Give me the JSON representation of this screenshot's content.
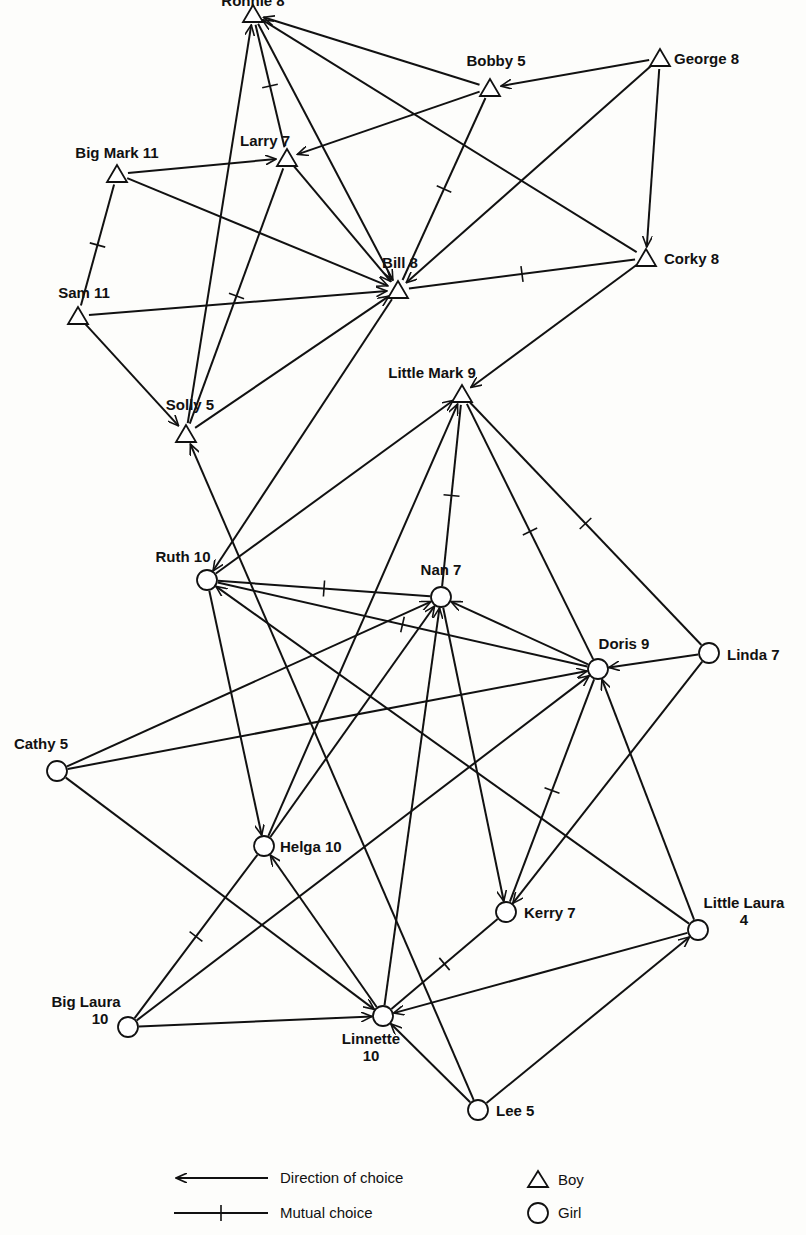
{
  "nodes": [
    {
      "id": "ronnie",
      "name": "Ronnie",
      "score": "8",
      "gender": "boy",
      "x": 253,
      "y": 14,
      "label_dx": 0,
      "label_dy": -8,
      "anchor": "middle"
    },
    {
      "id": "bobby",
      "name": "Bobby",
      "score": "5",
      "gender": "boy",
      "x": 490,
      "y": 88,
      "label_dx": 6,
      "label_dy": -22,
      "anchor": "middle"
    },
    {
      "id": "george",
      "name": "George",
      "score": "8",
      "gender": "boy",
      "x": 660,
      "y": 58,
      "label_dx": 14,
      "label_dy": 6,
      "anchor": "start"
    },
    {
      "id": "larry",
      "name": "Larry",
      "score": "7",
      "gender": "boy",
      "x": 287,
      "y": 158,
      "label_dx": -22,
      "label_dy": -12,
      "anchor": "middle"
    },
    {
      "id": "bigmark",
      "name": "Big Mark",
      "score": "11",
      "gender": "boy",
      "x": 117,
      "y": 174,
      "label_dx": 0,
      "label_dy": -16,
      "anchor": "middle"
    },
    {
      "id": "bill",
      "name": "Bill",
      "score": "8",
      "gender": "boy",
      "x": 398,
      "y": 290,
      "label_dx": 2,
      "label_dy": -22,
      "anchor": "middle"
    },
    {
      "id": "corky",
      "name": "Corky",
      "score": "8",
      "gender": "boy",
      "x": 646,
      "y": 258,
      "label_dx": 18,
      "label_dy": 6,
      "anchor": "start"
    },
    {
      "id": "sam",
      "name": "Sam",
      "score": "11",
      "gender": "boy",
      "x": 78,
      "y": 316,
      "label_dx": 6,
      "label_dy": -18,
      "anchor": "middle"
    },
    {
      "id": "littlemark",
      "name": "Little Mark",
      "score": "9",
      "gender": "boy",
      "x": 462,
      "y": 394,
      "label_dx": -30,
      "label_dy": -16,
      "anchor": "middle"
    },
    {
      "id": "solly",
      "name": "Solly",
      "score": "5",
      "gender": "boy",
      "x": 186,
      "y": 434,
      "label_dx": 4,
      "label_dy": -24,
      "anchor": "middle"
    },
    {
      "id": "ruth",
      "name": "Ruth",
      "score": "10",
      "gender": "girl",
      "x": 207,
      "y": 580,
      "label_dx": -24,
      "label_dy": -18,
      "anchor": "middle"
    },
    {
      "id": "nan",
      "name": "Nan",
      "score": "7",
      "gender": "girl",
      "x": 441,
      "y": 597,
      "label_dx": 0,
      "label_dy": -22,
      "anchor": "middle"
    },
    {
      "id": "doris",
      "name": "Doris",
      "score": "9",
      "gender": "girl",
      "x": 598,
      "y": 669,
      "label_dx": 26,
      "label_dy": -20,
      "anchor": "middle"
    },
    {
      "id": "linda",
      "name": "Linda",
      "score": "7",
      "gender": "girl",
      "x": 709,
      "y": 653,
      "label_dx": 18,
      "label_dy": 7,
      "anchor": "start"
    },
    {
      "id": "cathy",
      "name": "Cathy",
      "score": "5",
      "gender": "girl",
      "x": 57,
      "y": 771,
      "label_dx": -16,
      "label_dy": -22,
      "anchor": "middle"
    },
    {
      "id": "helga",
      "name": "Helga",
      "score": "10",
      "gender": "girl",
      "x": 264,
      "y": 846,
      "label_dx": 16,
      "label_dy": 6,
      "anchor": "start"
    },
    {
      "id": "kerry",
      "name": "Kerry",
      "score": "7",
      "gender": "girl",
      "x": 506,
      "y": 912,
      "label_dx": 18,
      "label_dy": 6,
      "anchor": "start"
    },
    {
      "id": "littlelaura",
      "name": "Little Laura",
      "score": "4",
      "gender": "girl",
      "x": 698,
      "y": 930,
      "label_dx": 46,
      "label_dy": -22,
      "anchor": "middle",
      "multiline": true
    },
    {
      "id": "biglaura",
      "name": "Big Laura",
      "score": "10",
      "gender": "girl",
      "x": 128,
      "y": 1027,
      "label_dx": -42,
      "label_dy": -20,
      "anchor": "middle",
      "multiline": true
    },
    {
      "id": "linnette",
      "name": "Linnette",
      "score": "10",
      "gender": "girl",
      "x": 383,
      "y": 1016,
      "label_dx": -12,
      "label_dy": 28,
      "anchor": "middle",
      "multiline": true
    },
    {
      "id": "lee",
      "name": "Lee",
      "score": "5",
      "gender": "girl",
      "x": 478,
      "y": 1110,
      "label_dx": 18,
      "label_dy": 6,
      "anchor": "start"
    }
  ],
  "edges": [
    {
      "from": "bobby",
      "to": "ronnie",
      "type": "directed"
    },
    {
      "from": "george",
      "to": "bobby",
      "type": "directed"
    },
    {
      "from": "larry",
      "to": "ronnie",
      "type": "mutual"
    },
    {
      "from": "bobby",
      "to": "larry",
      "type": "directed"
    },
    {
      "from": "bigmark",
      "to": "larry",
      "type": "directed"
    },
    {
      "from": "ronnie",
      "to": "bill",
      "type": "directed"
    },
    {
      "from": "larry",
      "to": "bill",
      "type": "directed"
    },
    {
      "from": "bigmark",
      "to": "bill",
      "type": "directed"
    },
    {
      "from": "bobby",
      "to": "bill",
      "type": "mutual"
    },
    {
      "from": "george",
      "to": "bill",
      "type": "directed"
    },
    {
      "from": "george",
      "to": "corky",
      "type": "directed"
    },
    {
      "from": "corky",
      "to": "ronnie",
      "type": "directed"
    },
    {
      "from": "corky",
      "to": "bill",
      "type": "mutual"
    },
    {
      "from": "sam",
      "to": "bigmark",
      "type": "mutual"
    },
    {
      "from": "sam",
      "to": "bill",
      "type": "directed"
    },
    {
      "from": "sam",
      "to": "solly",
      "type": "directed"
    },
    {
      "from": "solly",
      "to": "ronnie",
      "type": "directed"
    },
    {
      "from": "solly",
      "to": "larry",
      "type": "mutual"
    },
    {
      "from": "solly",
      "to": "bill",
      "type": "directed"
    },
    {
      "from": "corky",
      "to": "littlemark",
      "type": "directed"
    },
    {
      "from": "bill",
      "to": "ruth",
      "type": "directed"
    },
    {
      "from": "ruth",
      "to": "littlemark",
      "type": "directed"
    },
    {
      "from": "lee",
      "to": "solly",
      "type": "directed"
    },
    {
      "from": "nan",
      "to": "littlemark",
      "type": "mutual"
    },
    {
      "from": "helga",
      "to": "littlemark",
      "type": "directed"
    },
    {
      "from": "doris",
      "to": "littlemark",
      "type": "mutual"
    },
    {
      "from": "linda",
      "to": "littlemark",
      "type": "mutual"
    },
    {
      "from": "ruth",
      "to": "nan",
      "type": "mutual"
    },
    {
      "from": "ruth",
      "to": "doris",
      "type": "mutual"
    },
    {
      "from": "doris",
      "to": "nan",
      "type": "directed"
    },
    {
      "from": "linda",
      "to": "doris",
      "type": "directed"
    },
    {
      "from": "cathy",
      "to": "nan",
      "type": "directed"
    },
    {
      "from": "cathy",
      "to": "doris",
      "type": "directed"
    },
    {
      "from": "ruth",
      "to": "helga",
      "type": "directed"
    },
    {
      "from": "helga",
      "to": "nan",
      "type": "directed"
    },
    {
      "from": "linnette",
      "to": "nan",
      "type": "directed"
    },
    {
      "from": "nan",
      "to": "kerry",
      "type": "directed"
    },
    {
      "from": "doris",
      "to": "kerry",
      "type": "mutual"
    },
    {
      "from": "linda",
      "to": "kerry",
      "type": "directed"
    },
    {
      "from": "littlelaura",
      "to": "ruth",
      "type": "directed"
    },
    {
      "from": "littlelaura",
      "to": "doris",
      "type": "directed"
    },
    {
      "from": "cathy",
      "to": "linnette",
      "type": "directed"
    },
    {
      "from": "linnette",
      "to": "helga",
      "type": "directed"
    },
    {
      "from": "biglaura",
      "to": "helga",
      "type": "mutual"
    },
    {
      "from": "biglaura",
      "to": "doris",
      "type": "directed"
    },
    {
      "from": "biglaura",
      "to": "linnette",
      "type": "directed"
    },
    {
      "from": "kerry",
      "to": "linnette",
      "type": "mutual"
    },
    {
      "from": "littlelaura",
      "to": "linnette",
      "type": "directed"
    },
    {
      "from": "lee",
      "to": "linnette",
      "type": "directed"
    },
    {
      "from": "lee",
      "to": "littlelaura",
      "type": "directed"
    }
  ],
  "legend": {
    "direction_label": "Direction of choice",
    "mutual_label": "Mutual choice",
    "boy_label": "Boy",
    "girl_label": "Girl"
  },
  "colors": {
    "ink": "#111111",
    "paper": "#fdfdfb"
  }
}
